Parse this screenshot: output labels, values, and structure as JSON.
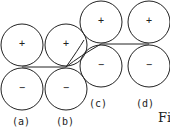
{
  "diagram": {
    "stroke_color": "#222222",
    "panels": [
      {
        "label": "(a)",
        "top_sign": "+",
        "bottom_sign": "−"
      },
      {
        "label": "(b)",
        "top_sign": "+",
        "bottom_sign": "−"
      },
      {
        "label": "(c)",
        "top_sign": "+",
        "bottom_sign": "−"
      },
      {
        "label": "(d)",
        "top_sign": "+",
        "bottom_sign": "−"
      }
    ],
    "caption_fragment": "Fi"
  }
}
